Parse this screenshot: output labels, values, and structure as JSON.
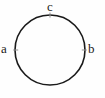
{
  "figure": {
    "type": "circle-diagram",
    "background_color": "#fefefe",
    "stroke_color": "#1a1a1a",
    "text_color": "#1a1a1a",
    "circle": {
      "center_x": 50,
      "center_y": 50,
      "radius": 35,
      "stroke_width": 1.6
    },
    "labels": {
      "left": "a",
      "right": "b",
      "top": "c"
    },
    "ticks": [
      {
        "name": "tick-left",
        "angle_deg": 180
      },
      {
        "name": "tick-right",
        "angle_deg": 0
      },
      {
        "name": "tick-top",
        "angle_deg": 90
      }
    ]
  }
}
